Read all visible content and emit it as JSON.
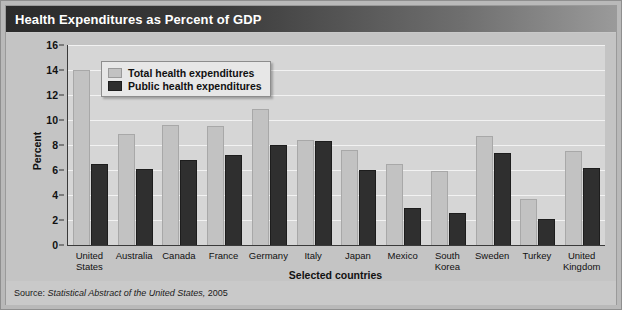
{
  "title": "Health Expenditures as Percent of GDP",
  "source": {
    "prefix": "Source:",
    "italic": "Statistical Abstract of the United States,",
    "year": "2005"
  },
  "legend": {
    "items": [
      {
        "label": "Total health expenditures",
        "color": "#c2c2c2",
        "key": "total"
      },
      {
        "label": "Public health expenditures",
        "color": "#2f2f2f",
        "key": "public"
      }
    ]
  },
  "axes": {
    "y_title": "Percent",
    "x_title": "Selected countries",
    "y_ticks": [
      "16",
      "14",
      "12",
      "10",
      "8",
      "6",
      "4",
      "2",
      "0"
    ]
  },
  "chart_data": {
    "type": "bar",
    "title": "Health Expenditures as Percent of GDP",
    "xlabel": "Selected countries",
    "ylabel": "Percent",
    "ylim": [
      0,
      16
    ],
    "ytick_step": 2,
    "grid": true,
    "legend_position": "upper-left-inside",
    "categories": [
      "United States",
      "Australia",
      "Canada",
      "France",
      "Germany",
      "Italy",
      "Japan",
      "Mexico",
      "South Korea",
      "Sweden",
      "Turkey",
      "United Kingdom"
    ],
    "category_lines": [
      [
        "United",
        "States"
      ],
      [
        "Australia"
      ],
      [
        "Canada"
      ],
      [
        "France"
      ],
      [
        "Germany"
      ],
      [
        "Italy"
      ],
      [
        "Japan"
      ],
      [
        "Mexico"
      ],
      [
        "South",
        "Korea"
      ],
      [
        "Sweden"
      ],
      [
        "Turkey"
      ],
      [
        "United",
        "Kingdom"
      ]
    ],
    "series": [
      {
        "name": "Total health expenditures",
        "color": "#c2c2c2",
        "values": [
          14.0,
          8.9,
          9.6,
          9.5,
          10.9,
          8.4,
          7.6,
          6.5,
          5.9,
          8.7,
          3.7,
          7.5
        ]
      },
      {
        "name": "Public health expenditures",
        "color": "#2f2f2f",
        "values": [
          6.5,
          6.1,
          6.8,
          7.2,
          8.0,
          8.3,
          6.0,
          3.0,
          2.6,
          7.4,
          2.1,
          6.2
        ]
      }
    ]
  }
}
